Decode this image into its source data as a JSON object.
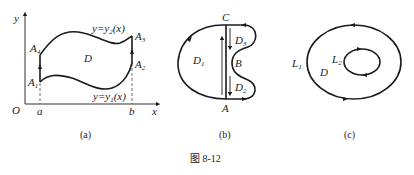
{
  "figure": {
    "caption": "图 8-12",
    "panels": [
      {
        "id": "a",
        "caption": "(a)",
        "axis_y": "y",
        "axis_x": "x",
        "origin": "O",
        "x_marks": [
          "a",
          "b"
        ],
        "region": "D",
        "upper_curve": "y=y",
        "upper_curve_sub": "2",
        "upper_curve_arg": "(x)",
        "lower_curve": "y=y",
        "lower_curve_sub": "1",
        "lower_curve_arg": "(x)",
        "points": [
          {
            "name": "A",
            "sub": "1"
          },
          {
            "name": "A",
            "sub": "2"
          },
          {
            "name": "A",
            "sub": "3"
          },
          {
            "name": "A",
            "sub": "4"
          }
        ]
      },
      {
        "id": "b",
        "caption": "(b)",
        "points": [
          "A",
          "B",
          "C"
        ],
        "regions": [
          {
            "name": "D",
            "sub": "1"
          },
          {
            "name": "D",
            "sub": "2"
          },
          {
            "name": "D",
            "sub": "3"
          }
        ]
      },
      {
        "id": "c",
        "caption": "(c)",
        "region": "D",
        "curves": [
          {
            "name": "L",
            "sub": "1"
          },
          {
            "name": "L",
            "sub": "2"
          }
        ]
      }
    ]
  }
}
